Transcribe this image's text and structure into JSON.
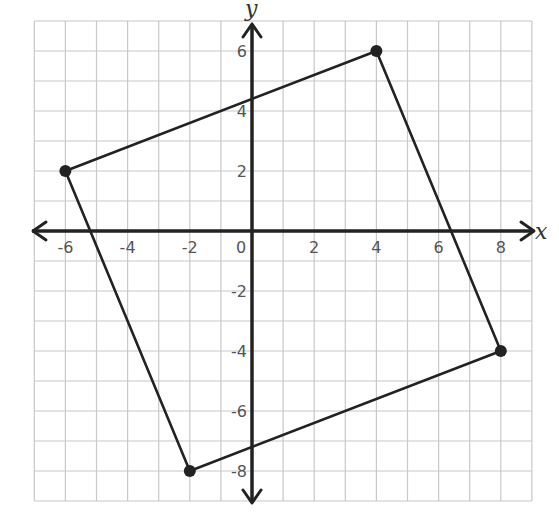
{
  "chart_data": {
    "type": "scatter",
    "title": "",
    "xlabel": "x",
    "ylabel": "y",
    "xlim": [
      -7,
      9
    ],
    "ylim": [
      -9,
      7
    ],
    "grid": true,
    "grid_step": 1,
    "x_ticks": [
      -6,
      -4,
      -2,
      0,
      2,
      4,
      6,
      8
    ],
    "y_ticks": [
      6,
      4,
      2,
      -2,
      -4,
      -6,
      -8
    ],
    "x_tick_labels": [
      "-6",
      "-4",
      "-2",
      "0",
      "2",
      "4",
      "6",
      "8"
    ],
    "y_tick_labels": [
      "6",
      "4",
      "2",
      "-2",
      "-4",
      "-6",
      "-8"
    ],
    "series": [
      {
        "name": "quadrilateral",
        "closed": true,
        "points": [
          {
            "x": -6,
            "y": 2
          },
          {
            "x": 4,
            "y": 6
          },
          {
            "x": 8,
            "y": -4
          },
          {
            "x": -2,
            "y": -8
          }
        ]
      }
    ],
    "colors": {
      "grid": "#c8c8c8",
      "axis": "#222222",
      "shape": "#222222",
      "tick_label": "#555555"
    }
  }
}
